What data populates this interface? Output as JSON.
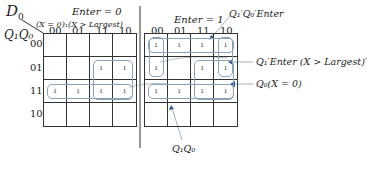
{
  "diagram": {
    "corner_var": "D",
    "corner_sub": "0",
    "row_var": "Q₁Q₀",
    "left_map": {
      "title": "Enter = 0",
      "subtitle": "(X = 0)₁(X > Largest)",
      "col_headers": [
        "00",
        "01",
        "11",
        "10"
      ],
      "row_headers": [
        "00",
        "01",
        "11",
        "10"
      ],
      "cells": [
        [
          "",
          "",
          "",
          ""
        ],
        [
          "",
          "",
          "1",
          "1"
        ],
        [
          "1",
          "1",
          "1",
          "1"
        ],
        [
          "",
          "",
          "",
          ""
        ]
      ]
    },
    "right_map": {
      "title": "Enter = 1",
      "col_headers": [
        "00",
        "01",
        "11",
        "10"
      ],
      "cells": [
        [
          "1",
          "1",
          "1",
          "1"
        ],
        [
          "1",
          "",
          "1",
          "1"
        ],
        [
          "1",
          "1",
          "1",
          "1"
        ],
        [
          "",
          "",
          "",
          ""
        ]
      ]
    },
    "annotations": [
      {
        "id": "q1q0enter",
        "text": "Q₁′Q₀′Enter"
      },
      {
        "id": "q1enter-xlargest",
        "text": "Q₁′Enter (X > Largest)′"
      },
      {
        "id": "q0-x0",
        "text": "Q₀(X = 0)"
      },
      {
        "id": "q1q0",
        "text": "Q₁Q₀"
      }
    ],
    "colors": {
      "grid": "#333333",
      "loop": "#8aa2b8",
      "arrow": "#2a5a9a"
    }
  }
}
